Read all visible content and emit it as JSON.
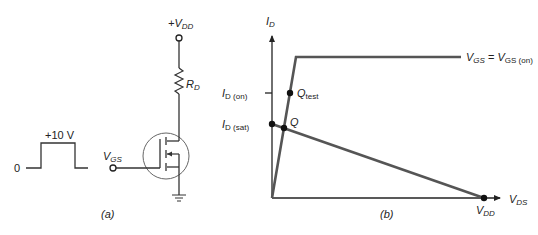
{
  "figure": {
    "panel_a": {
      "caption": "(a)",
      "pulse": {
        "low_label": "0",
        "high_label": "+10 V"
      },
      "supply_label": {
        "main": "+V",
        "sub": "DD"
      },
      "resistor_label": {
        "main": "R",
        "sub": "D"
      },
      "gate_label": {
        "main": "V",
        "sub": "GS"
      },
      "components": [
        "voltage pulse",
        "supply terminal +VDD",
        "drain resistor RD",
        "enhancement-mode MOSFET",
        "gate input VGS",
        "ground"
      ]
    },
    "panel_b": {
      "caption": "(b)",
      "y_axis_label": {
        "main": "I",
        "sub": "D"
      },
      "x_axis_label": {
        "main": "V",
        "sub": "DS"
      },
      "curve_label": {
        "left_main": "V",
        "left_sub": "GS",
        "equals": " = ",
        "right_main": "V",
        "right_sub": "GS (on)"
      },
      "tick_id_on": {
        "main": "I",
        "sub": "D (on)"
      },
      "tick_id_sat": {
        "main": "I",
        "sub": "D (sat)"
      },
      "point_qtest": {
        "main": "Q",
        "sub": "test"
      },
      "point_q": {
        "main": "Q"
      },
      "point_vdd": {
        "main": "V",
        "sub": "DD"
      }
    }
  },
  "colors": {
    "ink": "#222222",
    "curve": "#555555",
    "circle": "#666666"
  }
}
